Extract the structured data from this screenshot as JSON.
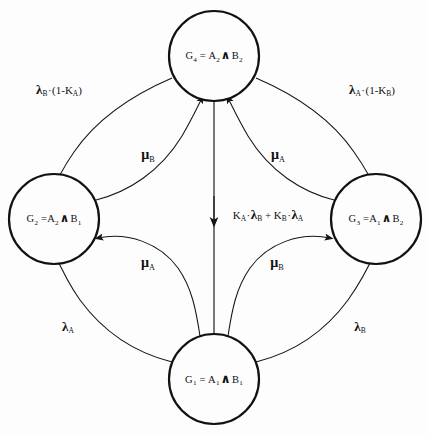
{
  "diagram": {
    "type": "state-transition-diagram",
    "title": "",
    "background_color": "#fdfdfd",
    "stroke_color": "#151515",
    "nodes": [
      {
        "id": "G4",
        "name": "node-g4",
        "position": "top",
        "cx": 214,
        "cy": 56,
        "r": 45,
        "label_parts": {
          "state": "G",
          "state_sub": "4",
          "eq": "=",
          "a": "A",
          "a_sub": "2",
          "wedge": "∧",
          "b": "B",
          "b_sub": "2"
        },
        "label_text": "G4 = A2 ∧ B2"
      },
      {
        "id": "G2",
        "name": "node-g2",
        "position": "left",
        "cx": 54,
        "cy": 219,
        "r": 45,
        "label_parts": {
          "state": "G",
          "state_sub": "2",
          "eq": "=",
          "a": "A",
          "a_sub": "2",
          "wedge": "∧",
          "b": "B",
          "b_sub": "1"
        },
        "label_text": "G2 = A2 ∧ B1"
      },
      {
        "id": "G3",
        "name": "node-g3",
        "position": "right",
        "cx": 376,
        "cy": 219,
        "r": 45,
        "label_parts": {
          "state": "G",
          "state_sub": "3",
          "eq": "=",
          "a": "A",
          "a_sub": "1",
          "wedge": "∧",
          "b": "B",
          "b_sub": "2"
        },
        "label_text": "G3 = A1 ∧ B2"
      },
      {
        "id": "G1",
        "name": "node-g1",
        "position": "bottom",
        "cx": 214,
        "cy": 379,
        "r": 45,
        "label_parts": {
          "state": "G",
          "state_sub": "1",
          "eq": "=",
          "a": "A",
          "a_sub": "1",
          "wedge": "∧",
          "b": "B",
          "b_sub": "1"
        },
        "label_text": "G1 = A1 ∧ B1"
      }
    ],
    "edges": [
      {
        "id": "e-g4-g2",
        "name": "edge-g4-to-g2",
        "from": "G4",
        "to": "G2",
        "label_text": "λB·(1-KA)",
        "label_parts": {
          "lam": "λ",
          "lam_sub": "B",
          "dot": "·",
          "open": "(1-",
          "k": "K",
          "k_sub": "A",
          "close": ")"
        },
        "label_x": 59,
        "label_y": 90
      },
      {
        "id": "e-g4-g3",
        "name": "edge-g4-to-g3",
        "from": "G4",
        "to": "G3",
        "label_text": "λA·(1-KB)",
        "label_parts": {
          "lam": "λ",
          "lam_sub": "A",
          "dot": "·",
          "open": "(1-",
          "k": "K",
          "k_sub": "B",
          "close": ")"
        },
        "label_x": 372,
        "label_y": 90
      },
      {
        "id": "e-g2-g4",
        "name": "edge-g2-to-g4",
        "from": "G2",
        "to": "G4",
        "label_text": "μB",
        "label_parts": {
          "mu": "μ",
          "mu_sub": "B"
        },
        "label_x": 148,
        "label_y": 155
      },
      {
        "id": "e-g3-g4",
        "name": "edge-g3-to-g4",
        "from": "G3",
        "to": "G4",
        "label_text": "μA",
        "label_parts": {
          "mu": "μ",
          "mu_sub": "A"
        },
        "label_x": 278,
        "label_y": 155
      },
      {
        "id": "e-g4-g1",
        "name": "edge-g4-to-g1",
        "from": "G4",
        "to": "G1",
        "label_text": "KA·λB + KB·λA",
        "label_parts": {
          "k1": "K",
          "k1_sub": "A",
          "dot1": "·",
          "lam1": "λ",
          "lam1_sub": "B",
          "plus": "+",
          "k2": "K",
          "k2_sub": "B",
          "dot2": "·",
          "lam2": "λ",
          "lam2_sub": "A"
        },
        "label_x": 268,
        "label_y": 215
      },
      {
        "id": "e-g1-g2-inner",
        "name": "edge-g1-to-g2-inner",
        "from": "G1",
        "to": "G2",
        "label_text": "μA",
        "label_parts": {
          "mu": "μ",
          "mu_sub": "A"
        },
        "label_x": 148,
        "label_y": 263
      },
      {
        "id": "e-g1-g3-inner",
        "name": "edge-g1-to-g3-inner",
        "from": "G1",
        "to": "G3",
        "label_text": "μB",
        "label_parts": {
          "mu": "μ",
          "mu_sub": "B"
        },
        "label_x": 277,
        "label_y": 263
      },
      {
        "id": "e-g1-g2-outer",
        "name": "edge-g1-to-g2-outer",
        "from": "G1",
        "to": "G2",
        "label_text": "λA",
        "label_parts": {
          "lam": "λ",
          "lam_sub": "A"
        },
        "label_x": 68,
        "label_y": 327
      },
      {
        "id": "e-g1-g3-outer",
        "name": "edge-g1-to-g3-outer",
        "from": "G1",
        "to": "G3",
        "label_text": "λB",
        "label_parts": {
          "lam": "λ",
          "lam_sub": "B"
        },
        "label_x": 360,
        "label_y": 327
      }
    ]
  }
}
